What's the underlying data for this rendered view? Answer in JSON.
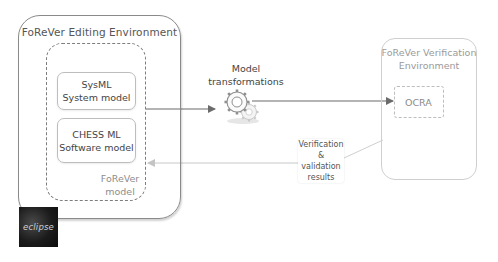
{
  "editing_environment": {
    "title": "FoReVer Editing Environment",
    "model_container": {
      "label_line1": "FoReVer",
      "label_line2": "model",
      "models": [
        {
          "line1": "SysML",
          "line2": "System model"
        },
        {
          "line1": "CHESS ML",
          "line2": "Software model"
        }
      ]
    },
    "logo": {
      "icon": "eclipse-logo-icon",
      "text": "eclipse"
    }
  },
  "transformation": {
    "label_line1": "Model",
    "label_line2": "transformations",
    "icon": "gears-icon"
  },
  "verification_environment": {
    "title_line1": "FoReVer Verification",
    "title_line2": "Environment",
    "tool": "OCRA"
  },
  "results_callout": {
    "line1": "Verification &",
    "line2": "validation",
    "line3": "results"
  },
  "colors": {
    "primary_stroke": "#7d7d7d",
    "faded_stroke": "#cfcfcf",
    "text": "#444444",
    "faded_text": "#9a9a9a"
  }
}
